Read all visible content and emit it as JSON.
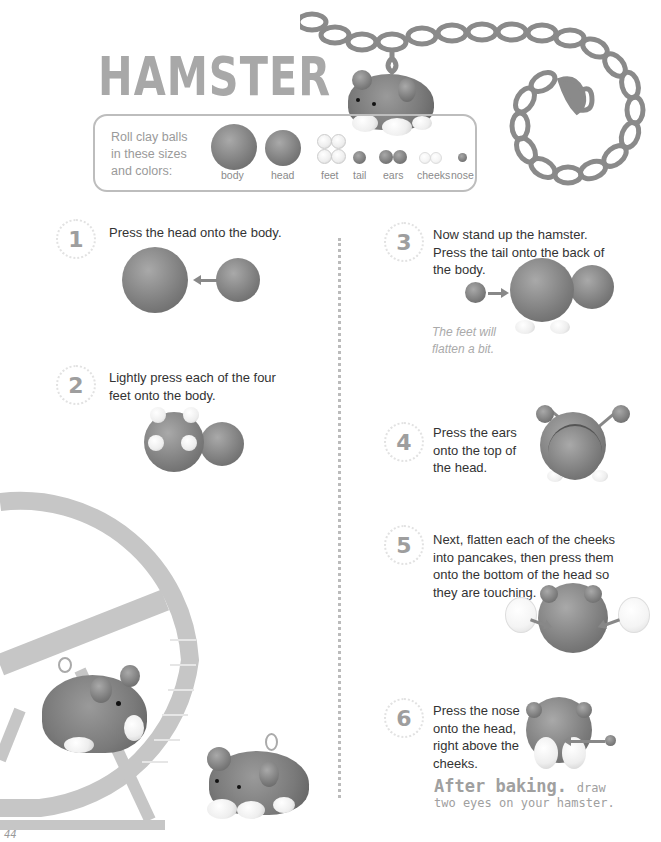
{
  "page": {
    "title": "HAMSTER",
    "page_number": "44"
  },
  "sizes": {
    "intro": [
      "Roll clay balls",
      "in these sizes",
      "and colors:"
    ],
    "items": [
      {
        "label": "body",
        "color": "#7c7c7c"
      },
      {
        "label": "head",
        "color": "#7c7c7c"
      },
      {
        "label": "feet",
        "color": "#eeeeee"
      },
      {
        "label": "tail",
        "color": "#7c7c7c"
      },
      {
        "label": "ears",
        "color": "#7c7c7c"
      },
      {
        "label": "cheeks",
        "color": "#f4f4f4"
      },
      {
        "label": "nose",
        "color": "#6e6e6e"
      }
    ]
  },
  "steps": [
    {
      "num": "1",
      "text": "Press the head onto the body."
    },
    {
      "num": "2",
      "text": "Lightly press each of the four feet onto the body."
    },
    {
      "num": "3",
      "text": "Now stand up the hamster. Press the tail onto the back of the body.",
      "note": "The feet will flatten a bit."
    },
    {
      "num": "4",
      "text": "Press the ears onto the top of the head."
    },
    {
      "num": "5",
      "text": "Next, flatten each of the cheeks into pancakes, then press them onto the bottom of the head so they are touching."
    },
    {
      "num": "6",
      "text": "Press the nose onto the head, right above the cheeks."
    }
  ],
  "after_baking": {
    "heading": "After baking.",
    "text_1": "draw",
    "text_2": "two eyes on your hamster."
  },
  "colors": {
    "title": "#a8a8a8",
    "clay": "#7c7c7c",
    "accent_gray": "#9e9e9e"
  }
}
